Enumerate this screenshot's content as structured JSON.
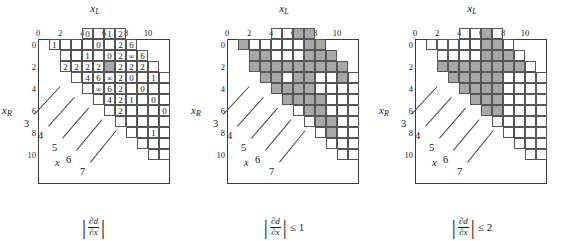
{
  "figure": {
    "width": 568,
    "height": 241,
    "grid_size": 12,
    "cell_px": 11,
    "shade_color": "#a8a8a8",
    "line_color": "#555555",
    "frame_color": "#3a3a3a"
  },
  "axes": {
    "x_label": "x",
    "x_sub": "L",
    "y_label": "x",
    "y_sub": "R",
    "ticks": [
      "0",
      "2",
      "4",
      "6",
      "8",
      "10"
    ],
    "tick_indices": [
      0,
      2,
      4,
      6,
      8,
      10
    ]
  },
  "leaders": {
    "labels": [
      "3",
      "4",
      "5",
      "6",
      "7"
    ],
    "x_marker": "x"
  },
  "panels": [
    {
      "id": "panel-1",
      "caption": {
        "abs": true,
        "num": "∂d",
        "den": "∂x",
        "relop": ""
      },
      "mode": "values"
    },
    {
      "id": "panel-2",
      "caption": {
        "abs": true,
        "num": "∂d",
        "den": "∂x",
        "relop": "≤ 1"
      },
      "mode": "shaded"
    },
    {
      "id": "panel-3",
      "caption": {
        "abs": true,
        "num": "∂d",
        "den": "∂x",
        "relop": "≤ 2"
      },
      "mode": "shaded"
    }
  ],
  "chart_data": {
    "type": "heatmap",
    "xlabel": "xL",
    "ylabel": "xR",
    "xlim": [
      0,
      12
    ],
    "ylim": [
      0,
      12
    ],
    "grid": true,
    "legend": "none",
    "band_rows": [
      {
        "row": 0,
        "c0": 4,
        "c1": 7
      },
      {
        "row": 1,
        "c0": 1,
        "c1": 8
      },
      {
        "row": 2,
        "c0": 2,
        "c1": 9
      },
      {
        "row": 3,
        "c0": 2,
        "c1": 10
      },
      {
        "row": 4,
        "c0": 3,
        "c1": 11
      },
      {
        "row": 5,
        "c0": 4,
        "c1": 11
      },
      {
        "row": 6,
        "c0": 5,
        "c1": 11
      },
      {
        "row": 7,
        "c0": 6,
        "c1": 11
      },
      {
        "row": 8,
        "c0": 7,
        "c1": 11
      },
      {
        "row": 9,
        "c0": 8,
        "c1": 11
      },
      {
        "row": 10,
        "c0": 9,
        "c1": 11
      },
      {
        "row": 11,
        "c0": 10,
        "c1": 11
      }
    ],
    "panel1_values": [
      {
        "r": 0,
        "c": 4,
        "v": "0"
      },
      {
        "r": 0,
        "c": 6,
        "v": "1"
      },
      {
        "r": 0,
        "c": 7,
        "v": "2"
      },
      {
        "r": 1,
        "c": 1,
        "v": "1"
      },
      {
        "r": 1,
        "c": 5,
        "v": "0"
      },
      {
        "r": 1,
        "c": 7,
        "v": "2"
      },
      {
        "r": 1,
        "c": 8,
        "v": "6"
      },
      {
        "r": 2,
        "c": 4,
        "v": "1"
      },
      {
        "r": 2,
        "c": 6,
        "v": "0"
      },
      {
        "r": 2,
        "c": 7,
        "v": "2"
      },
      {
        "r": 2,
        "c": 8,
        "v": "∞"
      },
      {
        "r": 2,
        "c": 9,
        "v": "6"
      },
      {
        "r": 3,
        "c": 2,
        "v": "2"
      },
      {
        "r": 3,
        "c": 3,
        "v": "2"
      },
      {
        "r": 3,
        "c": 4,
        "v": "2"
      },
      {
        "r": 3,
        "c": 5,
        "v": "2"
      },
      {
        "r": 3,
        "c": 7,
        "v": "2"
      },
      {
        "r": 3,
        "c": 8,
        "v": "2"
      },
      {
        "r": 3,
        "c": 9,
        "v": "2"
      },
      {
        "r": 4,
        "c": 4,
        "v": "4"
      },
      {
        "r": 4,
        "c": 5,
        "v": "6"
      },
      {
        "r": 4,
        "c": 6,
        "v": "∞"
      },
      {
        "r": 4,
        "c": 7,
        "v": "2"
      },
      {
        "r": 4,
        "c": 8,
        "v": "0"
      },
      {
        "r": 4,
        "c": 10,
        "v": "1"
      },
      {
        "r": 5,
        "c": 5,
        "v": "∞"
      },
      {
        "r": 5,
        "c": 6,
        "v": "6"
      },
      {
        "r": 5,
        "c": 7,
        "v": "2"
      },
      {
        "r": 5,
        "c": 9,
        "v": "0"
      },
      {
        "r": 6,
        "c": 6,
        "v": "4"
      },
      {
        "r": 6,
        "c": 7,
        "v": "2"
      },
      {
        "r": 6,
        "c": 8,
        "v": "1"
      },
      {
        "r": 6,
        "c": 10,
        "v": "0"
      },
      {
        "r": 7,
        "c": 7,
        "v": "2"
      },
      {
        "r": 7,
        "c": 11,
        "v": "0"
      },
      {
        "r": 9,
        "c": 10,
        "v": "1"
      }
    ],
    "panel1_highlight": {
      "r": 3,
      "c": 6
    },
    "panel2_shaded": [
      {
        "r": 0,
        "c": 6
      },
      {
        "r": 0,
        "c": 7
      },
      {
        "r": 1,
        "c": 1
      },
      {
        "r": 1,
        "c": 7
      },
      {
        "r": 1,
        "c": 8
      },
      {
        "r": 2,
        "c": 2
      },
      {
        "r": 2,
        "c": 3
      },
      {
        "r": 2,
        "c": 7
      },
      {
        "r": 2,
        "c": 8
      },
      {
        "r": 2,
        "c": 9
      },
      {
        "r": 3,
        "c": 2
      },
      {
        "r": 3,
        "c": 3
      },
      {
        "r": 3,
        "c": 4
      },
      {
        "r": 3,
        "c": 5
      },
      {
        "r": 3,
        "c": 6
      },
      {
        "r": 3,
        "c": 7
      },
      {
        "r": 3,
        "c": 8
      },
      {
        "r": 3,
        "c": 9
      },
      {
        "r": 3,
        "c": 10
      },
      {
        "r": 4,
        "c": 3
      },
      {
        "r": 4,
        "c": 4
      },
      {
        "r": 4,
        "c": 6
      },
      {
        "r": 4,
        "c": 7
      },
      {
        "r": 4,
        "c": 10
      },
      {
        "r": 5,
        "c": 4
      },
      {
        "r": 5,
        "c": 5
      },
      {
        "r": 5,
        "c": 6
      },
      {
        "r": 5,
        "c": 7
      },
      {
        "r": 6,
        "c": 5
      },
      {
        "r": 6,
        "c": 6
      },
      {
        "r": 6,
        "c": 7
      },
      {
        "r": 6,
        "c": 8
      },
      {
        "r": 7,
        "c": 7
      },
      {
        "r": 7,
        "c": 8
      },
      {
        "r": 8,
        "c": 8
      },
      {
        "r": 8,
        "c": 9
      },
      {
        "r": 9,
        "c": 9
      }
    ],
    "panel3_shaded": [
      {
        "r": 0,
        "c": 6
      },
      {
        "r": 1,
        "c": 6
      },
      {
        "r": 1,
        "c": 7
      },
      {
        "r": 2,
        "c": 6
      },
      {
        "r": 2,
        "c": 7
      },
      {
        "r": 2,
        "c": 8
      },
      {
        "r": 3,
        "c": 2
      },
      {
        "r": 3,
        "c": 3
      },
      {
        "r": 3,
        "c": 4
      },
      {
        "r": 3,
        "c": 5
      },
      {
        "r": 3,
        "c": 6
      },
      {
        "r": 3,
        "c": 7
      },
      {
        "r": 3,
        "c": 8
      },
      {
        "r": 3,
        "c": 9
      },
      {
        "r": 4,
        "c": 3
      },
      {
        "r": 4,
        "c": 4
      },
      {
        "r": 4,
        "c": 5
      },
      {
        "r": 4,
        "c": 6
      },
      {
        "r": 4,
        "c": 7
      },
      {
        "r": 5,
        "c": 4
      },
      {
        "r": 5,
        "c": 5
      },
      {
        "r": 5,
        "c": 6
      },
      {
        "r": 5,
        "c": 7
      },
      {
        "r": 6,
        "c": 5
      },
      {
        "r": 6,
        "c": 6
      },
      {
        "r": 6,
        "c": 7
      },
      {
        "r": 7,
        "c": 6
      },
      {
        "r": 7,
        "c": 7
      }
    ]
  }
}
